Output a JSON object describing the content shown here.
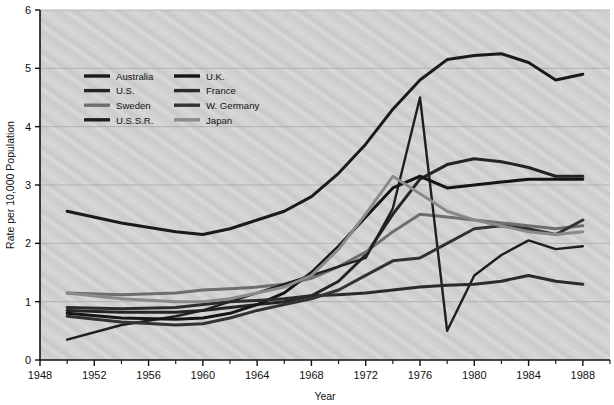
{
  "chart_data": {
    "type": "line",
    "title": "",
    "xlabel": "Year",
    "ylabel": "Rate per 10,000 Population",
    "xlim": [
      1948,
      1990
    ],
    "ylim": [
      0,
      6
    ],
    "grid": true,
    "legend_position": "upper-left-inside",
    "x_major_ticks": [
      1948,
      1952,
      1956,
      1960,
      1964,
      1968,
      1972,
      1976,
      1980,
      1984,
      1988
    ],
    "x_minor_ticks": [
      1950,
      1954,
      1958,
      1962,
      1966,
      1970,
      1974,
      1978,
      1982,
      1986,
      1990
    ],
    "x_tick_labels": [
      "1948",
      "1952",
      "1956",
      "1960",
      "1964",
      "1968",
      "1972",
      "1976",
      "1980",
      "1984",
      "1988"
    ],
    "y_ticks": [
      0,
      1,
      2,
      3,
      4,
      5,
      6
    ],
    "y_tick_labels": [
      "0",
      "1",
      "2",
      "3",
      "4",
      "5",
      "6"
    ],
    "series": [
      {
        "name": "Australia",
        "color": "#1a1a1a",
        "width": 3.0,
        "x": [
          1950,
          1954,
          1958,
          1960,
          1962,
          1964,
          1966,
          1968,
          1970,
          1972,
          1974,
          1976,
          1978,
          1980,
          1982,
          1984,
          1986,
          1988
        ],
        "values": [
          2.55,
          2.35,
          2.2,
          2.15,
          2.25,
          2.4,
          2.55,
          2.8,
          3.2,
          3.7,
          4.3,
          4.8,
          5.15,
          5.22,
          5.25,
          5.1,
          4.8,
          4.9
        ]
      },
      {
        "name": "U.S.",
        "color": "#242424",
        "width": 3.0,
        "x": [
          1950,
          1954,
          1958,
          1960,
          1962,
          1964,
          1966,
          1968,
          1970,
          1972,
          1974,
          1976,
          1978,
          1980,
          1982,
          1984,
          1986,
          1988
        ],
        "values": [
          0.85,
          0.82,
          0.82,
          0.85,
          0.9,
          0.95,
          1.0,
          1.1,
          1.35,
          1.8,
          2.5,
          3.1,
          3.35,
          3.45,
          3.4,
          3.3,
          3.15,
          3.15
        ]
      },
      {
        "name": "Sweden",
        "color": "#6e6e6e",
        "width": 3.0,
        "x": [
          1950,
          1954,
          1958,
          1960,
          1962,
          1964,
          1966,
          1968,
          1970,
          1972,
          1974,
          1976,
          1978,
          1980,
          1982,
          1984,
          1986,
          1988
        ],
        "values": [
          1.15,
          1.12,
          1.15,
          1.2,
          1.22,
          1.25,
          1.3,
          1.4,
          1.6,
          1.85,
          2.2,
          2.5,
          2.45,
          2.4,
          2.35,
          2.3,
          2.25,
          2.3
        ]
      },
      {
        "name": "U.S.S.R.",
        "color": "#1f1f1f",
        "width": 2.4,
        "x": [
          1950,
          1954,
          1958,
          1960,
          1962,
          1964,
          1966,
          1968,
          1970,
          1972,
          1974,
          1976,
          1978,
          1980,
          1982,
          1984,
          1986,
          1988
        ],
        "values": [
          0.35,
          0.6,
          0.75,
          0.85,
          1.0,
          1.15,
          1.3,
          1.45,
          1.6,
          1.75,
          2.6,
          4.5,
          0.5,
          1.45,
          1.8,
          2.05,
          1.9,
          1.95
        ]
      },
      {
        "name": "U.K.",
        "color": "#151515",
        "width": 3.0,
        "x": [
          1950,
          1954,
          1958,
          1960,
          1962,
          1964,
          1966,
          1968,
          1970,
          1972,
          1974,
          1976,
          1978,
          1980,
          1982,
          1984,
          1986,
          1988
        ],
        "values": [
          0.8,
          0.72,
          0.7,
          0.72,
          0.8,
          0.95,
          1.15,
          1.5,
          1.95,
          2.45,
          2.95,
          3.15,
          2.95,
          3.0,
          3.05,
          3.1,
          3.1,
          3.1
        ]
      },
      {
        "name": "France",
        "color": "#2b2b2b",
        "width": 3.0,
        "x": [
          1950,
          1954,
          1958,
          1960,
          1962,
          1964,
          1966,
          1968,
          1970,
          1972,
          1974,
          1976,
          1978,
          1980,
          1982,
          1984,
          1986,
          1988
        ],
        "values": [
          0.9,
          0.88,
          0.9,
          0.95,
          1.0,
          1.02,
          1.05,
          1.1,
          1.12,
          1.15,
          1.2,
          1.25,
          1.28,
          1.3,
          1.35,
          1.45,
          1.35,
          1.3
        ]
      },
      {
        "name": "W. Germany",
        "color": "#333333",
        "width": 3.0,
        "x": [
          1950,
          1954,
          1958,
          1960,
          1962,
          1964,
          1966,
          1968,
          1970,
          1972,
          1974,
          1976,
          1978,
          1980,
          1982,
          1984,
          1986,
          1988
        ],
        "values": [
          0.75,
          0.65,
          0.6,
          0.62,
          0.72,
          0.85,
          0.95,
          1.05,
          1.2,
          1.45,
          1.7,
          1.75,
          2.0,
          2.25,
          2.3,
          2.25,
          2.15,
          2.4
        ]
      },
      {
        "name": "Japan",
        "color": "#8a8a8a",
        "width": 3.0,
        "x": [
          1950,
          1954,
          1958,
          1960,
          1962,
          1964,
          1966,
          1968,
          1970,
          1972,
          1974,
          1976,
          1978,
          1980,
          1982,
          1984,
          1986,
          1988
        ],
        "values": [
          1.15,
          1.05,
          1.0,
          1.0,
          1.05,
          1.15,
          1.25,
          1.45,
          1.9,
          2.5,
          3.15,
          2.85,
          2.55,
          2.4,
          2.3,
          2.2,
          2.15,
          2.2
        ]
      }
    ]
  },
  "legend": {
    "entries": [
      {
        "label": "Australia",
        "color": "#1a1a1a"
      },
      {
        "label": "U.K.",
        "color": "#151515"
      },
      {
        "label": "U.S.",
        "color": "#242424"
      },
      {
        "label": "France",
        "color": "#2b2b2b"
      },
      {
        "label": "Sweden",
        "color": "#6e6e6e"
      },
      {
        "label": "W. Germany",
        "color": "#333333"
      },
      {
        "label": "U.S.S.R.",
        "color": "#1f1f1f"
      },
      {
        "label": "Japan",
        "color": "#8a8a8a"
      }
    ]
  },
  "style": {
    "plot_background": "#d2d2d2",
    "grid_color": "#a8a8a8",
    "axis_color": "#111111",
    "page_background": "#ffffff"
  }
}
